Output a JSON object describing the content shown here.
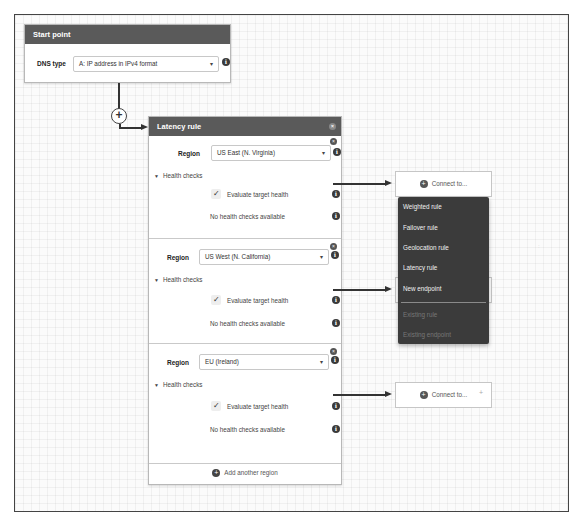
{
  "start_point": {
    "title": "Start point",
    "dns_type_label": "DNS type",
    "dns_type_value": "A: IP address in IPv4 format"
  },
  "latency_rule": {
    "title": "Latency rule",
    "region_label": "Region",
    "health_checks_label": "Health checks",
    "evaluate_label": "Evaluate target health",
    "no_health_checks": "No health checks available",
    "regions": [
      {
        "value": "US East (N. Virginia)",
        "evaluate_target_health": true
      },
      {
        "value": "US West (N. California)",
        "evaluate_target_health": true
      },
      {
        "value": "EU (Ireland)",
        "evaluate_target_health": true
      }
    ],
    "add_region_label": "Add another region"
  },
  "connect": {
    "label": "Connect to..."
  },
  "connect_menu": {
    "items": [
      {
        "label": "Weighted rule",
        "enabled": true
      },
      {
        "label": "Failover rule",
        "enabled": true
      },
      {
        "label": "Geolocation rule",
        "enabled": true
      },
      {
        "label": "Latency rule",
        "enabled": true
      },
      {
        "label": "New endpoint",
        "enabled": true
      },
      {
        "label": "Existing rule",
        "enabled": false
      },
      {
        "label": "Existing endpoint",
        "enabled": false
      }
    ]
  },
  "icons": {
    "info": "i",
    "close": "×",
    "plus": "+",
    "caret": "▾",
    "check": "✓",
    "tri": "▼"
  },
  "colors": {
    "header_bg": "#5a5a5a",
    "menu_bg": "#3b3b3b"
  }
}
